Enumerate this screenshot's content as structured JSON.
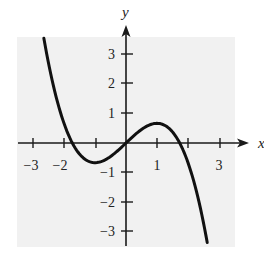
{
  "chart_data": {
    "type": "line",
    "title": "",
    "xlabel": "x",
    "ylabel": "y",
    "xlim": [
      -3.5,
      3.5
    ],
    "ylim": [
      -3.6,
      3.6
    ],
    "x_ticks": [
      -3,
      -2,
      -1,
      0,
      1,
      2,
      3
    ],
    "x_tick_labels": [
      "-3",
      "-2",
      "",
      "",
      "1",
      "",
      "3"
    ],
    "y_ticks": [
      -3,
      -2,
      -1,
      0,
      1,
      2,
      3
    ],
    "y_tick_labels": [
      "-3",
      "-2",
      "-1",
      "",
      "1",
      "2",
      "3"
    ],
    "grid": false,
    "legend": null,
    "series": [
      {
        "name": "f(x) = x - x^3/3",
        "x": [
          -2.65,
          -2.5,
          -2.25,
          -2.0,
          -1.75,
          -1.5,
          -1.25,
          -1.0,
          -0.75,
          -0.5,
          -0.25,
          0.0,
          0.25,
          0.5,
          0.75,
          1.0,
          1.25,
          1.5,
          1.75,
          2.0,
          2.25,
          2.5,
          2.62
        ],
        "values": [
          3.55,
          2.71,
          1.55,
          0.67,
          -0.04,
          -0.38,
          -0.6,
          -0.67,
          -0.61,
          -0.46,
          -0.24,
          0.0,
          0.24,
          0.46,
          0.61,
          0.67,
          0.6,
          0.38,
          0.04,
          -0.67,
          -1.55,
          -2.71,
          -3.37
        ]
      }
    ],
    "annotations": {
      "local_max": [
        1,
        0.67
      ],
      "local_min": [
        -1,
        -0.67
      ],
      "roots": [
        -1.73,
        0,
        1.73
      ]
    }
  },
  "labels": {
    "x_axis": "x",
    "y_axis": "y",
    "xt_m3": "−3",
    "xt_m2": "−2",
    "xt_1": "1",
    "xt_3": "3",
    "yt_3": "3",
    "yt_2": "2",
    "yt_1": "1",
    "yt_m1": "−1",
    "yt_m2": "−2",
    "yt_m3": "−3"
  },
  "colors": {
    "background": "#ffffff",
    "plot_area": "#f1f1f1",
    "axis": "#1a1a1a",
    "curve": "#111111"
  }
}
